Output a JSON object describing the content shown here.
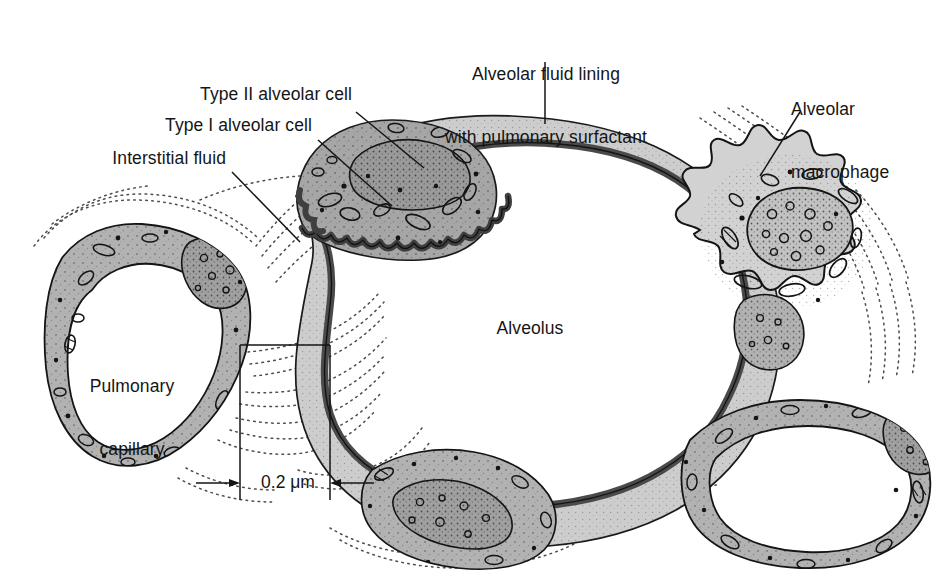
{
  "figure": {
    "background": "#ffffff"
  },
  "labels": {
    "alveolar_fluid_lining": {
      "line1": "Alveolar fluid lining",
      "line2": "with pulmonary surfactant"
    },
    "type_ii_alveolar_cell": "Type II alveolar cell",
    "type_i_alveolar_cell": "Type I alveolar cell",
    "interstitial_fluid": "Interstitial fluid",
    "alveolar_macrophage": {
      "line1": "Alveolar",
      "line2": "macrophage"
    },
    "alveolus": "Alveolus",
    "pulmonary_capillary": {
      "line1": "Pulmonary",
      "line2": "capillary"
    }
  },
  "scale_bar": {
    "value": "0.2 μm",
    "left_arrow": "left-arrow-icon",
    "right_arrow": "right-arrow-icon"
  },
  "colors": {
    "ink": "#151515",
    "outline": "#1a1a1a",
    "surfactant_dark": "#4a4a4a",
    "type_ii_cytoplasm": "#a6a6a6",
    "endothelium_gray": "#b2b2b2",
    "type_i_light": "#cdcdcd",
    "macrophage_gray": "#d2d2d2",
    "lumen_white": "#ffffff",
    "interstitial_dots": "#4d4d4d"
  },
  "structures": [
    {
      "name": "alveolus-lumen",
      "kind": "air-space",
      "fill": "#ffffff"
    },
    {
      "name": "type-i-alveolar-cell",
      "kind": "squamous-epithelium",
      "fill": "#cdcdcd"
    },
    {
      "name": "type-ii-alveolar-cell",
      "kind": "surfactant-secreting-cell",
      "fill": "#a6a6a6"
    },
    {
      "name": "alveolar-fluid-lining",
      "kind": "surfactant-layer",
      "fill": "#4a4a4a"
    },
    {
      "name": "alveolar-macrophage",
      "kind": "phagocyte",
      "fill": "#d2d2d2"
    },
    {
      "name": "pulmonary-capillary-left",
      "kind": "capillary",
      "fill": "#b2b2b2"
    },
    {
      "name": "pulmonary-capillary-bottom",
      "kind": "capillary",
      "fill": "#b2b2b2"
    },
    {
      "name": "pulmonary-capillary-right",
      "kind": "capillary",
      "fill": "#b2b2b2"
    },
    {
      "name": "interstitial-fluid",
      "kind": "connective-space",
      "fill": "dotted"
    }
  ]
}
